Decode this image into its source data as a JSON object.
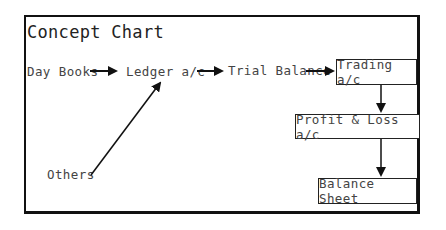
{
  "title": "Concept Chart",
  "nodes": {
    "day_books": "Day Books",
    "ledger": "Ledger a/c",
    "trial_balance": "Trial Balance",
    "trading": "Trading a/c",
    "profit_loss": "Profit & Loss a/c",
    "balance_sheet": "Balance Sheet",
    "others": "Others"
  },
  "edges": [
    {
      "from": "Day Books",
      "to": "Ledger a/c"
    },
    {
      "from": "Others",
      "to": "Ledger a/c"
    },
    {
      "from": "Ledger a/c",
      "to": "Trial Balance"
    },
    {
      "from": "Trial Balance",
      "to": "Trading a/c"
    },
    {
      "from": "Trading a/c",
      "to": "Profit & Loss a/c"
    },
    {
      "from": "Profit & Loss a/c",
      "to": "Balance Sheet"
    }
  ]
}
